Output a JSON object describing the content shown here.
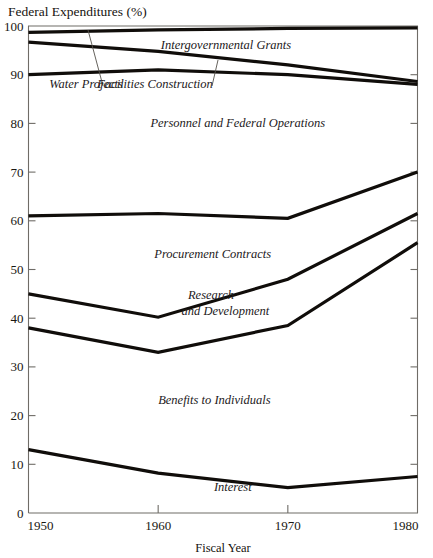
{
  "chart_data": {
    "type": "line",
    "title": "",
    "ylabel": "Federal Expenditures (%)",
    "xlabel": "Fiscal Year",
    "x": [
      1950,
      1960,
      1970,
      1980
    ],
    "xtick_labels": [
      "1950",
      "1960",
      "1970",
      "1980"
    ],
    "ytick_labels": [
      "0",
      "10",
      "20",
      "30",
      "40",
      "50",
      "60",
      "70",
      "80",
      "90",
      "100"
    ],
    "yticks": [
      0,
      10,
      20,
      30,
      40,
      50,
      60,
      70,
      80,
      90,
      100
    ],
    "ylim": [
      0,
      100
    ],
    "xlim": [
      1950,
      1980
    ],
    "grid": false,
    "legend": "inline-band-labels",
    "series": [
      {
        "name": "Water Projects (upper boundary)",
        "values": [
          98.7,
          99.2,
          99.5,
          99.6
        ]
      },
      {
        "name": "Facilities Construction (upper boundary)",
        "values": [
          96.7,
          94.8,
          92.0,
          88.6
        ]
      },
      {
        "name": "Personnel and Federal Operations (upper boundary)",
        "values": [
          90.0,
          91.0,
          90.0,
          88.0
        ]
      },
      {
        "name": "Procurement Contracts (upper boundary)",
        "values": [
          61.0,
          61.5,
          60.5,
          70.0
        ]
      },
      {
        "name": "Research and Development (upper boundary)",
        "values": [
          45.0,
          40.2,
          48.0,
          61.5
        ]
      },
      {
        "name": "Benefits to Individuals (upper boundary)",
        "values": [
          38.0,
          33.0,
          38.5,
          55.5
        ]
      },
      {
        "name": "Interest (upper boundary)",
        "values": [
          13.0,
          8.2,
          5.2,
          7.5
        ]
      }
    ],
    "band_labels": [
      {
        "text": "Intergovernmental Grants",
        "x": 1960.2,
        "y": 95.2
      },
      {
        "text": "Water Projects",
        "x": 1951.6,
        "y": 87.3
      },
      {
        "text": "Facilities Construction",
        "x": 1955.3,
        "y": 87.3
      },
      {
        "text": "Personnel and Federal Operations",
        "x": 1959.4,
        "y": 79.3
      },
      {
        "text": "Procurement Contracts",
        "x": 1959.7,
        "y": 52.4
      },
      {
        "text": "Research",
        "x": 1962.3,
        "y": 44.0
      },
      {
        "text": "and Development",
        "x": 1961.8,
        "y": 40.6
      },
      {
        "text": "Benefits to Individuals",
        "x": 1960.0,
        "y": 22.4
      },
      {
        "text": "Interest",
        "x": 1964.3,
        "y": 4.5
      }
    ],
    "leader_lines": [
      {
        "from_x": 1963.8,
        "from_y": 99.3,
        "to_x": 1967.2,
        "to_y": 88.6
      },
      {
        "from_x": 1993.2,
        "from_y": 93.0,
        "to_x": 1992.0,
        "to_y": 88.6
      }
    ]
  },
  "colors": {
    "line": "#100d0a",
    "frame": "#6f6c67",
    "background": "#ffffff",
    "text": "#16130f"
  }
}
